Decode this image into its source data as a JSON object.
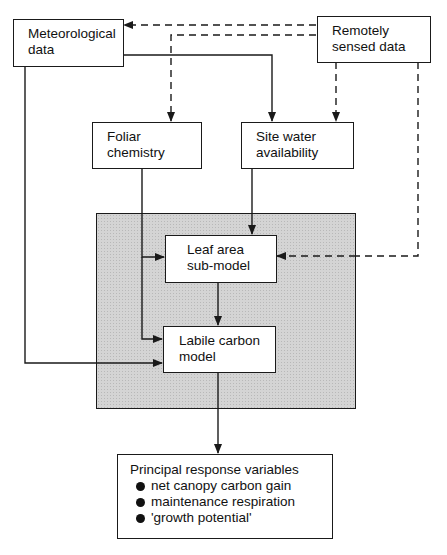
{
  "nodes": {
    "meteorological": {
      "lines": [
        "Meteorological",
        "data"
      ]
    },
    "remote": {
      "lines": [
        "Remotely",
        "sensed data"
      ]
    },
    "foliar": {
      "lines": [
        "Foliar",
        "chemistry"
      ]
    },
    "water": {
      "lines": [
        "Site water",
        "availability"
      ]
    },
    "leaf": {
      "lines": [
        "Leaf area",
        "sub-model"
      ]
    },
    "labile": {
      "lines": [
        "Labile carbon",
        "model"
      ]
    },
    "principal": {
      "title": "Principal response variables",
      "items": [
        "net canopy carbon gain",
        "maintenance respiration",
        "'growth potential'"
      ]
    }
  },
  "colors": {
    "line": "#1a1a1a",
    "shade": "#d4d4d4",
    "background": "#ffffff"
  }
}
